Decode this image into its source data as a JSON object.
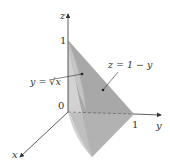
{
  "diagram": {
    "axes": {
      "z_label": "z",
      "y_label": "y",
      "x_label": "x",
      "origin_label": "0",
      "z_tick": "1",
      "y_tick": "1"
    },
    "annotations": {
      "curve_surface": "y = √x",
      "plane_surface": "z = 1 − y"
    },
    "colors": {
      "light_region": "#c8c8c8",
      "dark_region": "#a9a9a9",
      "axis": "#333333",
      "background": "#ffffff"
    }
  }
}
